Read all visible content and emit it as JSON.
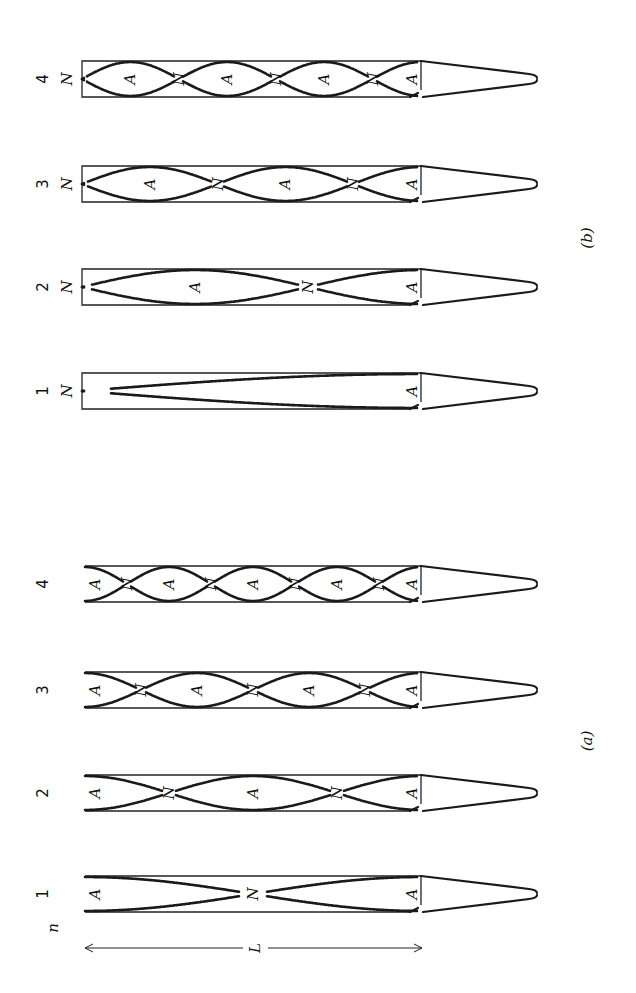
{
  "figure": {
    "orientation": "rotated-90-ccw",
    "panels": [
      {
        "id": "b",
        "caption": "(b)",
        "pipe_type": "closed-open",
        "pipes": [
          {
            "n": "4",
            "left_end_label": "N",
            "node_labels": [
              "N",
              "N",
              "N"
            ],
            "antinode_labels": [
              "A",
              "A",
              "A",
              "A"
            ]
          },
          {
            "n": "3",
            "left_end_label": "N",
            "node_labels": [
              "N",
              "N"
            ],
            "antinode_labels": [
              "A",
              "A",
              "A"
            ]
          },
          {
            "n": "2",
            "left_end_label": "N",
            "node_labels": [
              "N"
            ],
            "antinode_labels": [
              "A",
              "A"
            ]
          },
          {
            "n": "1",
            "left_end_label": "N",
            "node_labels": [],
            "antinode_labels": [
              "A"
            ]
          }
        ]
      },
      {
        "id": "a",
        "caption": "(a)",
        "pipe_type": "open-open",
        "pipes": [
          {
            "n": "4",
            "node_labels": [
              "N",
              "N",
              "N",
              "N"
            ],
            "antinode_labels": [
              "A",
              "A",
              "A",
              "A",
              "A"
            ]
          },
          {
            "n": "3",
            "node_labels": [
              "N",
              "N",
              "N"
            ],
            "antinode_labels": [
              "A",
              "A",
              "A",
              "A"
            ]
          },
          {
            "n": "2",
            "node_labels": [
              "N",
              "N"
            ],
            "antinode_labels": [
              "A",
              "A",
              "A"
            ]
          },
          {
            "n": "1",
            "node_labels": [
              "N"
            ],
            "antinode_labels": [
              "A",
              "A"
            ]
          }
        ]
      }
    ],
    "n_axis_label": "n",
    "length_label": "L",
    "node_symbol": "N",
    "antinode_symbol": "A"
  },
  "colors": {
    "ink": "#1a1a1a",
    "background": "#ffffff"
  }
}
